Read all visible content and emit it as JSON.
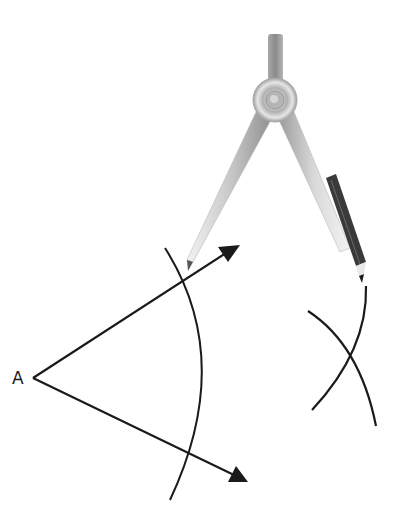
{
  "diagram": {
    "vertex_label": "A",
    "colors": {
      "line": "#1a1a1a",
      "compass_metal_light": "#e8e8e8",
      "compass_metal_dark": "#9a9a9a",
      "pencil": "#3a3a3a"
    },
    "elements": {
      "vertex": {
        "x": 33,
        "y": 378
      },
      "ray_upper_tip": {
        "x": 240,
        "y": 245
      },
      "ray_lower_tip": {
        "x": 248,
        "y": 482
      },
      "arc_left": {
        "start": [
          165,
          248
        ],
        "mid": [
          213,
          380
        ],
        "end": [
          170,
          500
        ]
      },
      "arc_right_1": {
        "start": [
          366,
          286
        ],
        "mid": [
          350,
          360
        ],
        "end": [
          312,
          410
        ]
      },
      "arc_right_2": {
        "start": [
          308,
          311
        ],
        "mid": [
          345,
          358
        ],
        "end": [
          376,
          426
        ]
      },
      "compass": {
        "hinge": [
          275,
          100
        ],
        "needle_tip": [
          188,
          270
        ],
        "pencil_tip": [
          362,
          282
        ]
      }
    }
  }
}
